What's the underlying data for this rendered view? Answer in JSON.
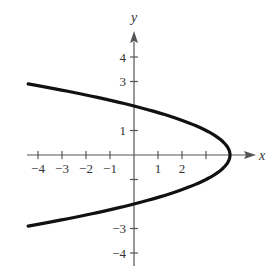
{
  "chart_data": {
    "type": "line",
    "title": "",
    "xlabel": "x",
    "ylabel": "y",
    "equation": "x = 4 - y^2",
    "xlim": [
      -4.4,
      4.8
    ],
    "ylim": [
      -4.5,
      4.9
    ],
    "grid": false,
    "legend": null,
    "x_ticks": [
      -4,
      -3,
      -2,
      -1,
      1,
      2,
      3
    ],
    "x_tick_labels": [
      "-4",
      "-3",
      "-2",
      "-1",
      "1",
      "2",
      ""
    ],
    "y_ticks": [
      -4,
      -3,
      -1,
      1,
      3,
      4
    ],
    "y_tick_labels": [
      "-4",
      "-3",
      "",
      "1",
      "3",
      "4"
    ],
    "series": [
      {
        "name": "parabola",
        "color": "#111111",
        "points": [
          {
            "x": -4.4,
            "y": 2.9
          },
          {
            "x": -4,
            "y": 2.83
          },
          {
            "x": -2,
            "y": 2.45
          },
          {
            "x": 0,
            "y": 2
          },
          {
            "x": 2,
            "y": 1.41
          },
          {
            "x": 3,
            "y": 1
          },
          {
            "x": 3.75,
            "y": 0.5
          },
          {
            "x": 4,
            "y": 0
          },
          {
            "x": 3.75,
            "y": -0.5
          },
          {
            "x": 3,
            "y": -1
          },
          {
            "x": 2,
            "y": -1.41
          },
          {
            "x": 0,
            "y": -2
          },
          {
            "x": -2,
            "y": -2.45
          },
          {
            "x": -4,
            "y": -2.83
          },
          {
            "x": -4.4,
            "y": -2.9
          }
        ]
      }
    ]
  },
  "labels": {
    "x_axis": "x",
    "y_axis": "y"
  }
}
